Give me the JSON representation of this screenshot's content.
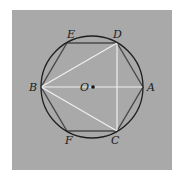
{
  "diagram": {
    "colors": {
      "background": "#ffffff",
      "panel": "#a9a9a9",
      "circle": "#1e1e1e",
      "hexagon": "#4a4a4a",
      "white_lines": "#f0f0f0",
      "center_dot": "#111111"
    },
    "circle": {
      "center": [
        92,
        87
      ],
      "radius": 51
    },
    "points": {
      "A": {
        "label": "A",
        "pos": [
          143,
          87
        ],
        "label_pos": [
          147,
          91
        ]
      },
      "B": {
        "label": "B",
        "pos": [
          41,
          87
        ],
        "label_pos": [
          29,
          91
        ]
      },
      "C": {
        "label": "C",
        "pos": [
          117,
          131
        ],
        "label_pos": [
          111,
          144
        ]
      },
      "D": {
        "label": "D",
        "pos": [
          117,
          43
        ],
        "label_pos": [
          113,
          38
        ]
      },
      "E": {
        "label": "E",
        "pos": [
          67,
          43
        ],
        "label_pos": [
          67,
          38
        ]
      },
      "F": {
        "label": "F",
        "pos": [
          67,
          131
        ],
        "label_pos": [
          65,
          144
        ]
      },
      "O": {
        "label": "O",
        "pos": [
          92,
          87
        ],
        "label_pos": [
          80,
          91
        ]
      }
    },
    "hexagon_order": [
      "A",
      "D",
      "E",
      "B",
      "F",
      "C"
    ],
    "white_segments": [
      [
        "B",
        "A"
      ],
      [
        "B",
        "D"
      ],
      [
        "B",
        "C"
      ],
      [
        "D",
        "C"
      ]
    ]
  }
}
